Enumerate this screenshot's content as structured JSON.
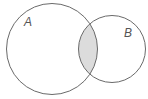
{
  "diagram": {
    "type": "venn",
    "sets": [
      {
        "label": "A",
        "cx": 52,
        "cy": 49,
        "r": 45.5,
        "label_x": 24,
        "label_y": 26
      },
      {
        "label": "B",
        "cx": 112,
        "cy": 49,
        "r": 33.5,
        "label_x": 124,
        "label_y": 37
      }
    ],
    "shaded_region": "A ∩ B",
    "colors": {
      "stroke": "#6a6a6a",
      "shade": "#dcdcdc",
      "background": "#ffffff"
    }
  }
}
